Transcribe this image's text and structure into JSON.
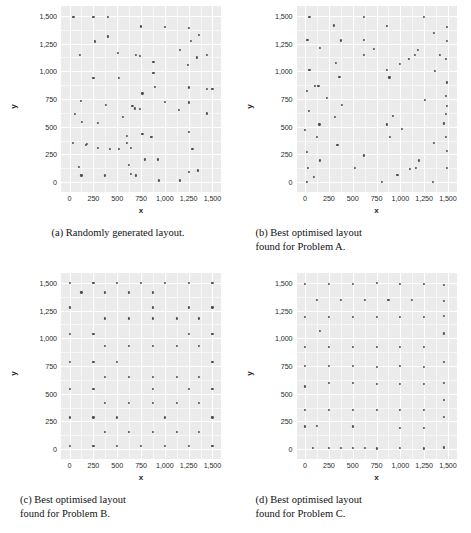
{
  "figure": {
    "panels": [
      {
        "key": "a",
        "caption_lines": [
          "(a) Randomly generated layout."
        ],
        "axis": {
          "xlabel": "x",
          "ylabel": "y",
          "xticks": [
            "0",
            "250",
            "500",
            "750",
            "1,000",
            "1,250",
            "1,500"
          ],
          "yticks": [
            "0",
            "250",
            "500",
            "750",
            "1,000",
            "1,250",
            "1,500"
          ],
          "xlim": [
            -90,
            1590
          ],
          "ylim": [
            -90,
            1590
          ]
        }
      },
      {
        "key": "b",
        "caption_lines": [
          "(b) Best optimised layout",
          "found for Problem A."
        ],
        "axis": {
          "xlabel": "x",
          "ylabel": "y",
          "xticks": [
            "0",
            "250",
            "500",
            "750",
            "1,000",
            "1,250",
            "1,500"
          ],
          "yticks": [
            "0",
            "250",
            "500",
            "750",
            "1,000",
            "1,250",
            "1,500"
          ],
          "xlim": [
            -90,
            1590
          ],
          "ylim": [
            -90,
            1590
          ]
        }
      },
      {
        "key": "c",
        "caption_lines": [
          "(c) Best optimised layout",
          "found for Problem B."
        ],
        "axis": {
          "xlabel": "x",
          "ylabel": "y",
          "xticks": [
            "0",
            "250",
            "500",
            "750",
            "1,000",
            "1,250",
            "1,500"
          ],
          "yticks": [
            "0",
            "250",
            "500",
            "750",
            "1,000",
            "1,250",
            "1,500"
          ],
          "xlim": [
            -90,
            1590
          ],
          "ylim": [
            -90,
            1590
          ]
        }
      },
      {
        "key": "d",
        "caption_lines": [
          "(d) Best optimised layout",
          "found for Problem C."
        ],
        "axis": {
          "xlabel": "x",
          "ylabel": "y",
          "xticks": [
            "0",
            "250",
            "500",
            "750",
            "1,000",
            "1,250",
            "1,500"
          ],
          "yticks": [
            "0",
            "250",
            "500",
            "750",
            "1,000",
            "1,250",
            "1,500"
          ],
          "xlim": [
            -90,
            1590
          ],
          "ylim": [
            -90,
            1590
          ]
        }
      }
    ]
  },
  "chart_data": [
    {
      "type": "scatter",
      "title": "(a) Randomly generated layout.",
      "xlabel": "x",
      "ylabel": "y",
      "xlim": [
        -90,
        1590
      ],
      "ylim": [
        -90,
        1590
      ],
      "xticks": [
        0,
        250,
        500,
        750,
        1000,
        1250,
        1500
      ],
      "yticks": [
        0,
        250,
        500,
        750,
        1000,
        1250,
        1500
      ],
      "grid": true,
      "legend": "none",
      "point_color": "#4d4d4d",
      "points": [
        [
          40,
          1490
        ],
        [
          250,
          1495
        ],
        [
          400,
          1490
        ],
        [
          750,
          1405
        ],
        [
          1000,
          1400
        ],
        [
          1250,
          1390
        ],
        [
          1355,
          1330
        ],
        [
          270,
          1270
        ],
        [
          400,
          1315
        ],
        [
          1270,
          1275
        ],
        [
          110,
          1150
        ],
        [
          510,
          1165
        ],
        [
          700,
          1150
        ],
        [
          740,
          1140
        ],
        [
          1160,
          1195
        ],
        [
          1335,
          1125
        ],
        [
          1440,
          1145
        ],
        [
          880,
          1085
        ],
        [
          1240,
          1060
        ],
        [
          250,
          940
        ],
        [
          520,
          940
        ],
        [
          880,
          985
        ],
        [
          120,
          730
        ],
        [
          380,
          700
        ],
        [
          660,
          690
        ],
        [
          1000,
          725
        ],
        [
          1250,
          720
        ],
        [
          1440,
          840
        ],
        [
          1250,
          855
        ],
        [
          900,
          860
        ],
        [
          765,
          800
        ],
        [
          1500,
          840
        ],
        [
          55,
          615
        ],
        [
          740,
          660
        ],
        [
          1150,
          650
        ],
        [
          1440,
          620
        ],
        [
          130,
          540
        ],
        [
          300,
          535
        ],
        [
          560,
          590
        ],
        [
          690,
          665
        ],
        [
          35,
          355
        ],
        [
          180,
          345
        ],
        [
          600,
          350
        ],
        [
          860,
          410
        ],
        [
          1250,
          455
        ],
        [
          600,
          420
        ],
        [
          765,
          435
        ],
        [
          420,
          300
        ],
        [
          520,
          300
        ],
        [
          640,
          305
        ],
        [
          300,
          310
        ],
        [
          175,
          335
        ],
        [
          1290,
          300
        ],
        [
          790,
          205
        ],
        [
          930,
          205
        ],
        [
          100,
          140
        ],
        [
          620,
          155
        ],
        [
          1250,
          90
        ],
        [
          1345,
          105
        ],
        [
          125,
          60
        ],
        [
          375,
          60
        ],
        [
          640,
          75
        ],
        [
          700,
          60
        ],
        [
          940,
          15
        ],
        [
          1155,
          15
        ]
      ]
    },
    {
      "type": "scatter",
      "title": "(b) Best optimised layout found for Problem A.",
      "xlabel": "x",
      "ylabel": "y",
      "xlim": [
        -90,
        1590
      ],
      "ylim": [
        -90,
        1590
      ],
      "xticks": [
        0,
        250,
        500,
        750,
        1000,
        1250,
        1500
      ],
      "yticks": [
        0,
        250,
        500,
        750,
        1000,
        1250,
        1500
      ],
      "grid": true,
      "legend": "none",
      "point_color": "#4d4d4d",
      "points": [
        [
          45,
          1495
        ],
        [
          615,
          1490
        ],
        [
          1245,
          1490
        ],
        [
          300,
          1415
        ],
        [
          855,
          1410
        ],
        [
          1350,
          1345
        ],
        [
          1490,
          1400
        ],
        [
          25,
          1285
        ],
        [
          375,
          1280
        ],
        [
          620,
          1285
        ],
        [
          1490,
          1275
        ],
        [
          160,
          1215
        ],
        [
          720,
          1205
        ],
        [
          1185,
          1195
        ],
        [
          320,
          1075
        ],
        [
          615,
          1150
        ],
        [
          1150,
          1150
        ],
        [
          1420,
          1150
        ],
        [
          1480,
          1115
        ],
        [
          45,
          1010
        ],
        [
          360,
          950
        ],
        [
          885,
          945
        ],
        [
          1000,
          1070
        ],
        [
          1090,
          1115
        ],
        [
          1360,
          1005
        ],
        [
          20,
          820
        ],
        [
          855,
          1010
        ],
        [
          1255,
          740
        ],
        [
          1490,
          900
        ],
        [
          1480,
          775
        ],
        [
          100,
          865
        ],
        [
          140,
          870
        ],
        [
          40,
          640
        ],
        [
          1490,
          690
        ],
        [
          1480,
          615
        ],
        [
          225,
          760
        ],
        [
          150,
          520
        ],
        [
          310,
          590
        ],
        [
          385,
          695
        ],
        [
          925,
          595
        ],
        [
          1460,
          530
        ],
        [
          0,
          470
        ],
        [
          15,
          275
        ],
        [
          125,
          405
        ],
        [
          340,
          335
        ],
        [
          855,
          520
        ],
        [
          890,
          410
        ],
        [
          1020,
          480
        ],
        [
          1350,
          350
        ],
        [
          1480,
          405
        ],
        [
          620,
          240
        ],
        [
          1490,
          280
        ],
        [
          30,
          130
        ],
        [
          155,
          195
        ],
        [
          1195,
          195
        ],
        [
          1100,
          115
        ],
        [
          1160,
          125
        ],
        [
          520,
          130
        ],
        [
          1490,
          125
        ],
        [
          95,
          45
        ],
        [
          970,
          65
        ],
        [
          15,
          0
        ],
        [
          810,
          0
        ],
        [
          1345,
          0
        ]
      ]
    },
    {
      "type": "scatter",
      "title": "(c) Best optimised layout found for Problem B.",
      "xlabel": "x",
      "ylabel": "y",
      "xlim": [
        -90,
        1590
      ],
      "ylim": [
        -90,
        1590
      ],
      "xticks": [
        0,
        250,
        500,
        750,
        1000,
        1250,
        1500
      ],
      "yticks": [
        0,
        250,
        500,
        750,
        1000,
        1250,
        1500
      ],
      "grid": true,
      "legend": "none",
      "point_color": "#4d4d4d",
      "points": [
        [
          0,
          1500
        ],
        [
          250,
          1500
        ],
        [
          500,
          1500
        ],
        [
          750,
          1500
        ],
        [
          1000,
          1500
        ],
        [
          1250,
          1500
        ],
        [
          1500,
          1500
        ],
        [
          125,
          1415
        ],
        [
          375,
          1415
        ],
        [
          625,
          1415
        ],
        [
          875,
          1415
        ],
        [
          0,
          1280
        ],
        [
          875,
          1280
        ],
        [
          1250,
          1280
        ],
        [
          1500,
          1280
        ],
        [
          375,
          1180
        ],
        [
          625,
          1180
        ],
        [
          875,
          1180
        ],
        [
          1125,
          1180
        ],
        [
          1355,
          1180
        ],
        [
          0,
          1040
        ],
        [
          250,
          1040
        ],
        [
          1250,
          1040
        ],
        [
          1500,
          1040
        ],
        [
          375,
          930
        ],
        [
          625,
          930
        ],
        [
          875,
          930
        ],
        [
          1125,
          930
        ],
        [
          1355,
          930
        ],
        [
          0,
          790
        ],
        [
          250,
          790
        ],
        [
          500,
          790
        ],
        [
          1500,
          790
        ],
        [
          375,
          655
        ],
        [
          625,
          655
        ],
        [
          875,
          655
        ],
        [
          1125,
          655
        ],
        [
          1355,
          655
        ],
        [
          0,
          540
        ],
        [
          250,
          540
        ],
        [
          875,
          540
        ],
        [
          1250,
          540
        ],
        [
          1500,
          540
        ],
        [
          375,
          415
        ],
        [
          625,
          415
        ],
        [
          875,
          415
        ],
        [
          1125,
          415
        ],
        [
          1355,
          415
        ],
        [
          0,
          285
        ],
        [
          250,
          285
        ],
        [
          500,
          285
        ],
        [
          1000,
          285
        ],
        [
          1500,
          285
        ],
        [
          375,
          155
        ],
        [
          625,
          155
        ],
        [
          875,
          155
        ],
        [
          1125,
          155
        ],
        [
          1355,
          155
        ],
        [
          0,
          30
        ],
        [
          250,
          30
        ],
        [
          500,
          30
        ],
        [
          750,
          30
        ],
        [
          1000,
          30
        ],
        [
          1250,
          30
        ],
        [
          1500,
          30
        ]
      ]
    },
    {
      "type": "scatter",
      "title": "(d) Best optimised layout found for Problem C.",
      "xlabel": "x",
      "ylabel": "y",
      "xlim": [
        -90,
        1590
      ],
      "ylim": [
        -90,
        1590
      ],
      "xticks": [
        0,
        250,
        500,
        750,
        1000,
        1250,
        1500
      ],
      "yticks": [
        0,
        250,
        500,
        750,
        1000,
        1250,
        1500
      ],
      "grid": true,
      "legend": "none",
      "point_color": "#4d4d4d",
      "points": [
        [
          0,
          1495
        ],
        [
          250,
          1495
        ],
        [
          500,
          1495
        ],
        [
          750,
          1500
        ],
        [
          1000,
          1495
        ],
        [
          1250,
          1495
        ],
        [
          1460,
          1480
        ],
        [
          125,
          1345
        ],
        [
          375,
          1345
        ],
        [
          625,
          1345
        ],
        [
          875,
          1345
        ],
        [
          1125,
          1345
        ],
        [
          1460,
          1340
        ],
        [
          0,
          1195
        ],
        [
          250,
          1190
        ],
        [
          500,
          1190
        ],
        [
          750,
          1195
        ],
        [
          1000,
          1190
        ],
        [
          1250,
          1190
        ],
        [
          1460,
          1200
        ],
        [
          160,
          1070
        ],
        [
          1460,
          1045
        ],
        [
          0,
          925
        ],
        [
          250,
          925
        ],
        [
          500,
          925
        ],
        [
          750,
          925
        ],
        [
          1000,
          925
        ],
        [
          1250,
          925
        ],
        [
          0,
          750
        ],
        [
          250,
          750
        ],
        [
          500,
          750
        ],
        [
          750,
          745
        ],
        [
          1000,
          750
        ],
        [
          1250,
          745
        ],
        [
          1460,
          790
        ],
        [
          0,
          565
        ],
        [
          250,
          595
        ],
        [
          500,
          595
        ],
        [
          750,
          590
        ],
        [
          1000,
          590
        ],
        [
          1250,
          590
        ],
        [
          1460,
          595
        ],
        [
          1460,
          445
        ],
        [
          0,
          355
        ],
        [
          250,
          355
        ],
        [
          500,
          355
        ],
        [
          750,
          355
        ],
        [
          1000,
          355
        ],
        [
          1250,
          355
        ],
        [
          1460,
          290
        ],
        [
          0,
          205
        ],
        [
          125,
          210
        ],
        [
          500,
          205
        ],
        [
          1000,
          190
        ],
        [
          1250,
          190
        ],
        [
          85,
          10
        ],
        [
          250,
          10
        ],
        [
          375,
          10
        ],
        [
          500,
          10
        ],
        [
          625,
          10
        ],
        [
          750,
          5
        ],
        [
          1000,
          10
        ],
        [
          1250,
          5
        ],
        [
          1460,
          15
        ]
      ]
    }
  ]
}
